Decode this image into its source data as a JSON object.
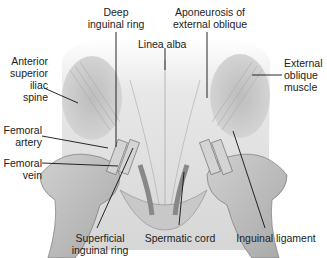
{
  "diagram": {
    "type": "anatomical illustration",
    "labels": {
      "deep_inguinal_ring": "Deep\ninguinal ring",
      "aponeurosis": "Aponeurosis of\nexternal oblique",
      "linea_alba": "Linea alba",
      "anterior_superior_iliac_spine": "Anterior\nsuperior\niliac\nspine",
      "external_oblique_muscle": "External\noblique\nmuscle",
      "femoral_artery": "Femoral\nartery",
      "femoral_vein": "Femoral\nvein",
      "superficial_inguinal_ring": "Superficial\ninguinal ring",
      "spermatic_cord": "Spermatic cord",
      "inguinal_ligament": "Inguinal ligament"
    }
  }
}
